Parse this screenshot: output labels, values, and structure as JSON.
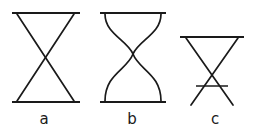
{
  "figure": {
    "background_color": "#ffffff",
    "stroke_color": "#1a1a1a",
    "width": 259,
    "height": 133,
    "panels": [
      {
        "id": "a",
        "label": "a",
        "label_x": 44,
        "label_y": 120,
        "kind": "straight-crossing",
        "top_rail": {
          "x1": 12,
          "y1": 13,
          "x2": 80,
          "y2": 13
        },
        "bottom_rail": {
          "x1": 12,
          "y1": 102,
          "x2": 80,
          "y2": 102
        },
        "strands": [
          {
            "name": "diagonal-left-to-right",
            "x1": 17,
            "y1": 14,
            "x2": 74,
            "y2": 101
          },
          {
            "name": "diagonal-right-to-left",
            "x1": 74,
            "y1": 14,
            "x2": 17,
            "y2": 101
          }
        ],
        "crossing_point": {
          "x": 46,
          "y": 58
        }
      },
      {
        "id": "b",
        "label": "b",
        "label_x": 132,
        "label_y": 120,
        "kind": "curved-crossing",
        "top_rail": {
          "x1": 100,
          "y1": 13,
          "x2": 166,
          "y2": 13
        },
        "bottom_rail": {
          "x1": 100,
          "y1": 102,
          "x2": 166,
          "y2": 102
        },
        "strands": [
          {
            "name": "curve-left-to-right",
            "path": "M 105,14 C 105,34 127,40 133,54 C 139,70 161,74 161,101"
          },
          {
            "name": "curve-right-to-left",
            "path": "M 161,14 C 161,34 139,40 133,54 C 127,70 105,74 105,101"
          }
        ],
        "crossing_point": {
          "x": 133,
          "y": 54
        }
      },
      {
        "id": "c",
        "label": "c",
        "label_x": 215,
        "label_y": 120,
        "kind": "straight-crossing-with-bar",
        "top_rail": {
          "x1": 180,
          "y1": 37,
          "x2": 244,
          "y2": 37
        },
        "bottom_rail": null,
        "cross_bar": {
          "x1": 196,
          "y1": 86,
          "x2": 228,
          "y2": 86
        },
        "strands": [
          {
            "name": "diagonal-left-to-right",
            "x1": 186,
            "y1": 38,
            "x2": 233,
            "y2": 105
          },
          {
            "name": "diagonal-right-to-left",
            "x1": 238,
            "y1": 38,
            "x2": 191,
            "y2": 105
          }
        ],
        "crossing_point": {
          "x": 212,
          "y": 70
        }
      }
    ]
  }
}
